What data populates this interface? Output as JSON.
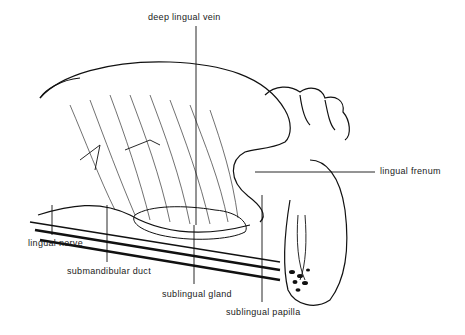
{
  "labels": {
    "deep_lingual_vein": "deep lingual vein",
    "lingual_frenum": "lingual frenum",
    "lingual_nerve": "lingual nerve",
    "submandibular_duct": "submandibular duct",
    "sublingual_gland": "sublingual gland",
    "sublingual_papilla": "sublingual papilla"
  }
}
